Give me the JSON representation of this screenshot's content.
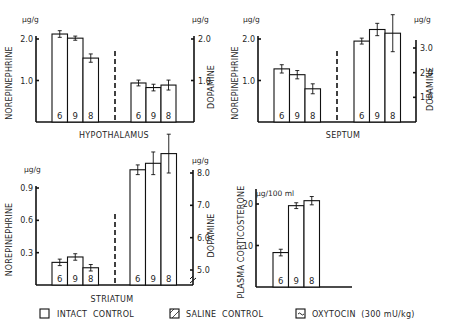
{
  "legend": {
    "items": [
      {
        "key": "intact",
        "label": "INTACT  CONTROL",
        "pattern": "open"
      },
      {
        "key": "saline",
        "label": "SALINE  CONTROL",
        "pattern": "hatched"
      },
      {
        "key": "oxytocin",
        "label": "OXYTOCIN  (300 mU/kg)",
        "pattern": "wavy"
      }
    ]
  },
  "chart_data": [
    {
      "type": "bar",
      "title": "HYPOTHALAMUS",
      "panels": [
        {
          "ylabel": "NOREPINEPHRINE",
          "unit": "µg/g",
          "axis": "left",
          "ylim": [
            0,
            2.0
          ],
          "ticks": [
            {
              "v": 1.0,
              "label": "1.0"
            },
            {
              "v": 2.0,
              "label": "2.0"
            }
          ],
          "categories": [
            "Intact control",
            "Saline control",
            "Oxytocin (300 mU/kg)"
          ],
          "values": [
            2.12,
            2.02,
            1.54
          ],
          "errors": [
            0.08,
            0.05,
            0.1
          ],
          "n": [
            6,
            9,
            8
          ]
        },
        {
          "ylabel": "DOPAMINE",
          "unit": "µg/g",
          "axis": "right",
          "ylim": [
            0,
            2.0
          ],
          "ticks": [
            {
              "v": 1.0,
              "label": "1.0"
            },
            {
              "v": 2.0,
              "label": "2.0"
            }
          ],
          "categories": [
            "Intact control",
            "Saline control",
            "Oxytocin (300 mU/kg)"
          ],
          "values": [
            0.94,
            0.83,
            0.89
          ],
          "errors": [
            0.07,
            0.08,
            0.12
          ],
          "n": [
            6,
            9,
            8
          ]
        }
      ]
    },
    {
      "type": "bar",
      "title": "SEPTUM",
      "panels": [
        {
          "ylabel": "NOREPINEPHRINE",
          "unit": "µg/g",
          "axis": "left",
          "ylim": [
            0,
            2.0
          ],
          "ticks": [
            {
              "v": 1.0,
              "label": "1.0"
            },
            {
              "v": 2.0,
              "label": "2.0"
            }
          ],
          "categories": [
            "Intact control",
            "Saline control",
            "Oxytocin (300 mU/kg)"
          ],
          "values": [
            1.28,
            1.14,
            0.8
          ],
          "errors": [
            0.1,
            0.1,
            0.12
          ],
          "n": [
            6,
            9,
            8
          ]
        },
        {
          "ylabel": "DOPAMINE",
          "unit": "µg/g",
          "axis": "right",
          "ylim": [
            0,
            3.5
          ],
          "ticks": [
            {
              "v": 1.0,
              "label": "1.0"
            },
            {
              "v": 2.0,
              "label": "2.0"
            },
            {
              "v": 3.0,
              "label": "3.0"
            }
          ],
          "categories": [
            "Intact control",
            "Saline control",
            "Oxytocin (300 mU/kg)"
          ],
          "values": [
            3.28,
            3.75,
            3.6
          ],
          "errors": [
            0.12,
            0.25,
            0.75
          ],
          "n": [
            6,
            9,
            8
          ]
        }
      ]
    },
    {
      "type": "bar",
      "title": "STRIATUM",
      "panels": [
        {
          "ylabel": "NOREPINEPHRINE",
          "unit": "µg/g",
          "axis": "left",
          "ylim": [
            0,
            0.9
          ],
          "ticks": [
            {
              "v": 0.3,
              "label": "0.3"
            },
            {
              "v": 0.6,
              "label": "0.6"
            },
            {
              "v": 0.9,
              "label": "0.9"
            }
          ],
          "categories": [
            "Intact control",
            "Saline control",
            "Oxytocin (300 mU/kg)"
          ],
          "values": [
            0.21,
            0.26,
            0.16
          ],
          "errors": [
            0.03,
            0.03,
            0.03
          ],
          "n": [
            6,
            9,
            8
          ]
        },
        {
          "ylabel": "DOPAMINE",
          "unit": "µg/g",
          "axis": "right",
          "ylim": [
            4.6,
            8.0
          ],
          "axis_break": true,
          "ticks": [
            {
              "v": 5.0,
              "label": "5.0"
            },
            {
              "v": 6.0,
              "label": "6.0"
            },
            {
              "v": 7.0,
              "label": "7.0"
            },
            {
              "v": 8.0,
              "label": "8.0"
            }
          ],
          "categories": [
            "Intact control",
            "Saline control",
            "Oxytocin (300 mU/kg)"
          ],
          "values": [
            8.1,
            8.3,
            8.6
          ],
          "errors": [
            0.15,
            0.35,
            0.6
          ],
          "n": [
            6,
            9,
            8
          ]
        }
      ]
    },
    {
      "type": "bar",
      "title": "",
      "panels": [
        {
          "ylabel": "PLASMA  CORTICOSTERONE",
          "unit": "µg/100 ml",
          "axis": "left",
          "ylim": [
            0,
            24
          ],
          "ticks": [
            {
              "v": 10,
              "label": "10"
            },
            {
              "v": 20,
              "label": "20"
            }
          ],
          "categories": [
            "Intact control",
            "Saline control",
            "Oxytocin (300 mU/kg)"
          ],
          "values": [
            8.3,
            19.6,
            20.8
          ],
          "errors": [
            0.8,
            0.7,
            1.0
          ],
          "n": [
            6,
            9,
            8
          ]
        }
      ]
    }
  ]
}
